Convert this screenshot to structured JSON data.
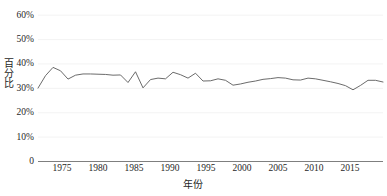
{
  "chart_data": {
    "type": "line",
    "title": "",
    "subtitle": "",
    "xlabel": "年份",
    "ylabel": "百分比",
    "xlim": [
      1972,
      2018
    ],
    "ylim": [
      0,
      60
    ],
    "grid": true,
    "legend": false,
    "legend_position": "none",
    "y_ticks": [
      0,
      10,
      20,
      30,
      40,
      50,
      60
    ],
    "y_tick_labels": [
      "0",
      "10%",
      "20%",
      "30%",
      "40%",
      "50%",
      "60%"
    ],
    "x_ticks": [
      1975,
      1980,
      1985,
      1990,
      1995,
      2000,
      2005,
      2010,
      2015
    ],
    "x_tick_labels": [
      "1975",
      "1980",
      "1985",
      "1990",
      "1995",
      "2000",
      "2005",
      "2010",
      "2015"
    ],
    "line_color": "#5a5a5a",
    "grid_color": "#f0f0f0",
    "axis_color": "#7f7f7f",
    "series": [
      {
        "name": "百分比",
        "x": [
          1972,
          1973,
          1974,
          1975,
          1976,
          1977,
          1978,
          1979,
          1980,
          1981,
          1982,
          1983,
          1984,
          1985,
          1986,
          1987,
          1988,
          1989,
          1990,
          1991,
          1992,
          1993,
          1994,
          1995,
          1996,
          1997,
          1998,
          1999,
          2000,
          2001,
          2002,
          2003,
          2004,
          2005,
          2006,
          2007,
          2008,
          2009,
          2010,
          2011,
          2012,
          2013,
          2014,
          2015,
          2016,
          2017,
          2018
        ],
        "values": [
          30.1,
          35.2,
          38.6,
          37.2,
          33.8,
          35.4,
          35.9,
          35.9,
          35.8,
          35.7,
          35.4,
          35.5,
          32.4,
          36.8,
          30.2,
          33.6,
          34.2,
          33.9,
          36.6,
          35.6,
          34.2,
          36.2,
          33.0,
          33.1,
          33.9,
          33.3,
          31.3,
          31.8,
          32.5,
          33.0,
          33.7,
          34.0,
          34.4,
          34.2,
          33.5,
          33.4,
          34.2,
          33.9,
          33.3,
          32.7,
          32.0,
          31.1,
          29.4,
          31.2,
          33.3,
          33.3,
          32.6
        ],
        "end_values_note": ""
      }
    ]
  }
}
